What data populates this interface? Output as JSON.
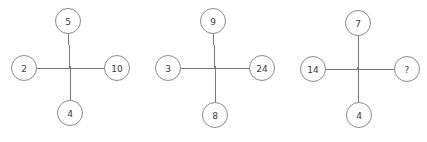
{
  "canvas": {
    "width": 427,
    "height": 142,
    "background": "#ffffff"
  },
  "style": {
    "line_color": "#787878",
    "circle_stroke": "#8a8a8a",
    "circle_fill": "#ffffff",
    "text_color": "#3a3a3a",
    "node_radius": 12.5,
    "font_size": 9
  },
  "diagram": {
    "type": "cross-number-puzzle",
    "crosses": [
      {
        "id": "cross-1",
        "center": {
          "x": 70,
          "y": 68
        },
        "nodes": {
          "top": {
            "label": "5",
            "cx": 68,
            "cy": 21
          },
          "left": {
            "label": "2",
            "cx": 24,
            "cy": 68
          },
          "right": {
            "label": "10",
            "cx": 117,
            "cy": 68
          },
          "bottom": {
            "label": "4",
            "cx": 70,
            "cy": 113
          }
        }
      },
      {
        "id": "cross-2",
        "center": {
          "x": 215,
          "y": 68
        },
        "nodes": {
          "top": {
            "label": "9",
            "cx": 213,
            "cy": 21
          },
          "left": {
            "label": "3",
            "cx": 168,
            "cy": 68
          },
          "right": {
            "label": "24",
            "cx": 262,
            "cy": 68
          },
          "bottom": {
            "label": "8",
            "cx": 215,
            "cy": 115
          }
        }
      },
      {
        "id": "cross-3",
        "center": {
          "x": 358,
          "y": 69
        },
        "nodes": {
          "top": {
            "label": "7",
            "cx": 358,
            "cy": 23
          },
          "left": {
            "label": "14",
            "cx": 313,
            "cy": 69
          },
          "right": {
            "label": "?",
            "cx": 407,
            "cy": 69
          },
          "bottom": {
            "label": "4",
            "cx": 359,
            "cy": 115
          }
        }
      }
    ]
  }
}
